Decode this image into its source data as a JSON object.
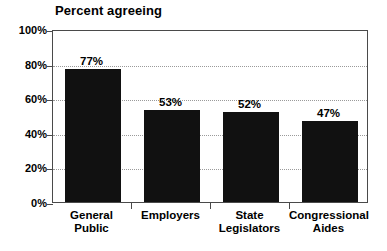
{
  "chart_data": {
    "type": "bar",
    "title": "Percent agreeing",
    "xlabel": "",
    "ylabel": "",
    "ylim": [
      0,
      100
    ],
    "ytick_labels": [
      "0%",
      "20%",
      "40%",
      "60%",
      "80%",
      "100%"
    ],
    "ytick_values": [
      0,
      20,
      40,
      60,
      80,
      100
    ],
    "grid": true,
    "legend": false,
    "bar_color": "#111111",
    "categories": [
      "General Public",
      "Employers",
      "State Legislators",
      "Congressional Aides"
    ],
    "category_lines": [
      [
        "General",
        "Public"
      ],
      [
        "Employers",
        ""
      ],
      [
        "State",
        "Legislators"
      ],
      [
        "Congressional",
        "Aides"
      ]
    ],
    "values": [
      77,
      53,
      52,
      47
    ],
    "value_labels": [
      "77%",
      "53%",
      "52%",
      "47%"
    ]
  }
}
